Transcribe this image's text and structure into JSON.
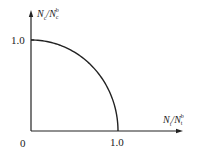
{
  "chart_data": {
    "type": "line",
    "title": "",
    "xlabel": "N_t/N_t^b",
    "ylabel": "N_c/N_c^b",
    "xlim": [
      0,
      1.0
    ],
    "ylim": [
      0,
      1.0
    ],
    "grid": false,
    "legend": null,
    "x_ticks": [
      "0",
      "1.0"
    ],
    "y_ticks": [
      "1.0"
    ],
    "series": [
      {
        "name": "interaction curve",
        "description": "quarter circle: (N_t/N_t^b)^2 + (N_c/N_c^b)^2 = 1",
        "x": [
          0.0,
          0.2,
          0.4,
          0.6,
          0.8,
          0.9,
          0.95,
          1.0
        ],
        "y": [
          1.0,
          0.98,
          0.917,
          0.8,
          0.6,
          0.436,
          0.312,
          0.0
        ]
      }
    ]
  },
  "axes": {
    "y_title": {
      "main1": "N",
      "sub1": "c",
      "slash": "/",
      "main2": "N",
      "sup2": "b",
      "sub2": "c"
    },
    "x_title": {
      "main1": "N",
      "sub1": "t",
      "slash": "/",
      "main2": "N",
      "sup2": "b",
      "sub2": "t"
    },
    "origin_label": "0",
    "x_tick_label": "1.0",
    "y_tick_label": "1.0"
  },
  "colors": {
    "line": "#222222",
    "background": "#ffffff"
  }
}
